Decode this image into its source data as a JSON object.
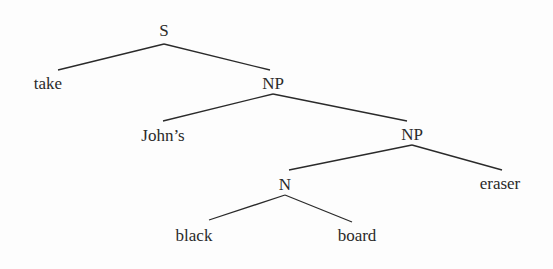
{
  "diagram": {
    "type": "syntax-tree",
    "line_color": "#2a2a2a",
    "text_color": "#2a2a2a",
    "nodes": [
      {
        "id": "S",
        "label": "S",
        "x": 164,
        "y": 30
      },
      {
        "id": "take",
        "label": "take",
        "x": 48,
        "y": 83
      },
      {
        "id": "NP1",
        "label": "NP",
        "x": 273,
        "y": 83
      },
      {
        "id": "johns",
        "label": "John’s",
        "x": 163,
        "y": 135
      },
      {
        "id": "NP2",
        "label": "NP",
        "x": 412,
        "y": 134
      },
      {
        "id": "N",
        "label": "N",
        "x": 285,
        "y": 184
      },
      {
        "id": "eraser",
        "label": "eraser",
        "x": 500,
        "y": 183
      },
      {
        "id": "black",
        "label": "black",
        "x": 194,
        "y": 235
      },
      {
        "id": "board",
        "label": "board",
        "x": 357,
        "y": 235
      }
    ],
    "edges": [
      {
        "from": "S",
        "to": "take",
        "x1": 164,
        "y1": 44,
        "x2": 58,
        "y2": 70
      },
      {
        "from": "S",
        "to": "NP1",
        "x1": 164,
        "y1": 44,
        "x2": 270,
        "y2": 70
      },
      {
        "from": "NP1",
        "to": "johns",
        "x1": 273,
        "y1": 94,
        "x2": 163,
        "y2": 121
      },
      {
        "from": "NP1",
        "to": "NP2",
        "x1": 273,
        "y1": 94,
        "x2": 407,
        "y2": 121
      },
      {
        "from": "NP2",
        "to": "N",
        "x1": 412,
        "y1": 145,
        "x2": 289,
        "y2": 170
      },
      {
        "from": "NP2",
        "to": "eraser",
        "x1": 412,
        "y1": 145,
        "x2": 502,
        "y2": 170
      },
      {
        "from": "N",
        "to": "black",
        "x1": 285,
        "y1": 195,
        "x2": 209,
        "y2": 220
      },
      {
        "from": "N",
        "to": "board",
        "x1": 285,
        "y1": 195,
        "x2": 352,
        "y2": 222
      }
    ]
  }
}
